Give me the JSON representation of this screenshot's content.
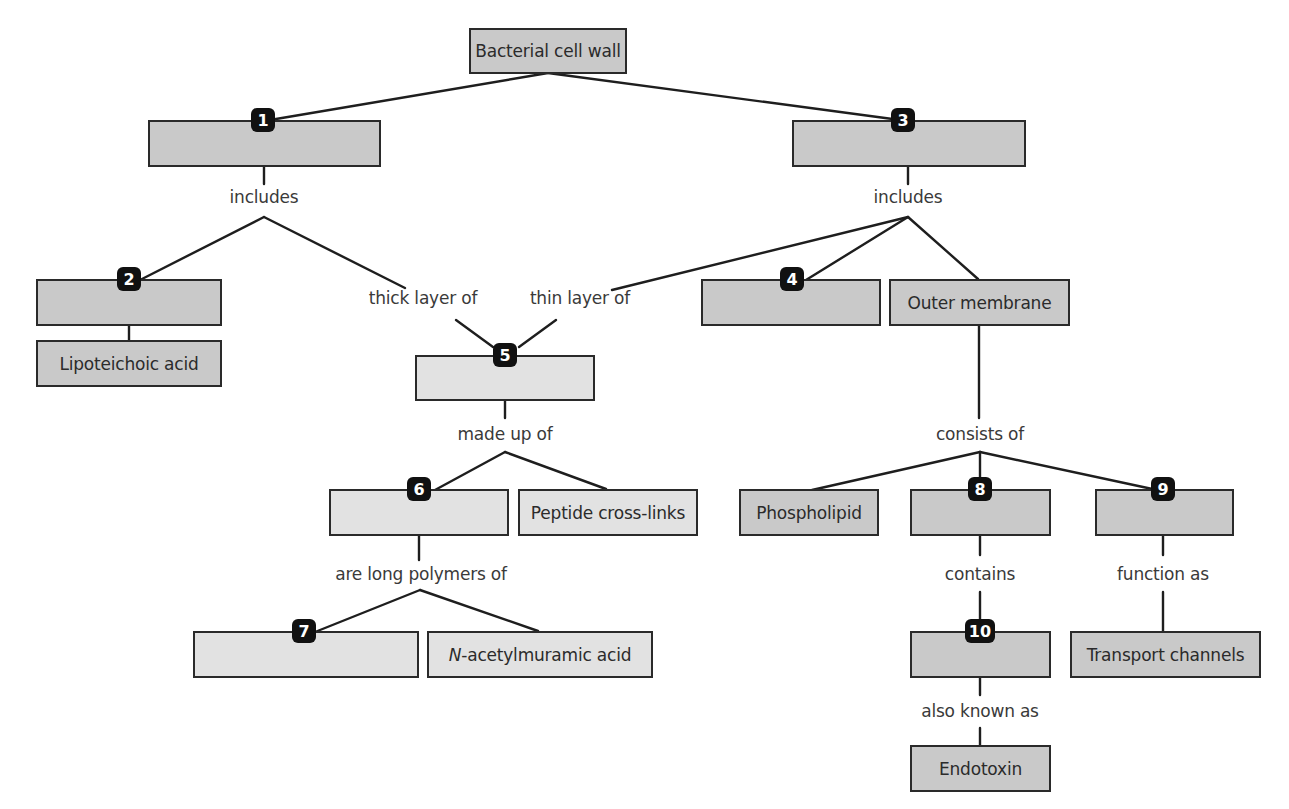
{
  "diagram": {
    "type": "concept-map",
    "root": {
      "id": "root",
      "label": "Bacterial cell wall"
    },
    "nodes": {
      "n1": {
        "badge": "1",
        "label": ""
      },
      "n2": {
        "badge": "2",
        "label": ""
      },
      "lipoteichoic": {
        "label": "Lipoteichoic acid"
      },
      "n3": {
        "badge": "3",
        "label": ""
      },
      "n4": {
        "badge": "4",
        "label": ""
      },
      "outer_membrane": {
        "label": "Outer membrane"
      },
      "n5": {
        "badge": "5",
        "label": ""
      },
      "n6": {
        "badge": "6",
        "label": ""
      },
      "peptide": {
        "label": "Peptide cross-links"
      },
      "n7": {
        "badge": "7",
        "label": ""
      },
      "nam_italic": "N",
      "nam_rest": "-acetylmuramic acid",
      "phospholipid": {
        "label": "Phospholipid"
      },
      "n8": {
        "badge": "8",
        "label": ""
      },
      "n9": {
        "badge": "9",
        "label": ""
      },
      "n10": {
        "badge": "10",
        "label": ""
      },
      "transport": {
        "label": "Transport channels"
      },
      "endotoxin": {
        "label": "Endotoxin"
      }
    },
    "link_labels": {
      "includes_left": "includes",
      "includes_right": "includes",
      "thick_layer": "thick layer of",
      "thin_layer": "thin layer of",
      "made_up_of": "made up of",
      "are_long_polymers": "are long polymers of",
      "consists_of": "consists of",
      "contains": "contains",
      "function_as": "function as",
      "also_known_as": "also known as"
    },
    "colors": {
      "dark_box": "#c9c9c9",
      "light_box": "#e2e2e2",
      "border": "#2a2a2a",
      "badge": "#111111"
    }
  }
}
